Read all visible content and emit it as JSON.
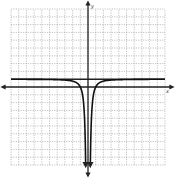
{
  "chart_data": {
    "type": "line",
    "title": "",
    "xlabel": "x",
    "ylabel": "y",
    "xlim": [
      -10,
      10
    ],
    "ylim": [
      -10,
      10
    ],
    "grid": true,
    "grid_step": 1,
    "asymptote": {
      "type": "horizontal",
      "y": 1
    },
    "vertical_asymptote": {
      "x": 0
    },
    "series": [
      {
        "name": "f(x) = 1 - 1/x^2",
        "equation_form": "y = 1 - a/x^2",
        "a": 1,
        "x_left": [
          -10,
          -5,
          -3,
          -2,
          -1.5,
          -1,
          -0.6,
          -0.4,
          -0.32
        ],
        "x_right": [
          0.32,
          0.4,
          0.6,
          1,
          1.5,
          2,
          3,
          5,
          10
        ]
      }
    ],
    "axis_labels": {
      "x": "x",
      "y": "y"
    }
  }
}
